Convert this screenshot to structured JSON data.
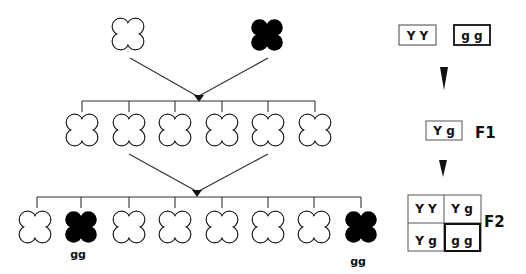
{
  "diagram": {
    "parents": [
      {
        "phenotype": "yellow",
        "fill": "#ffffff",
        "cx": 128,
        "cy": 34
      },
      {
        "phenotype": "green",
        "fill": "#000000",
        "cx": 267,
        "cy": 35
      }
    ],
    "f1_offspring": {
      "count": 6,
      "centers_x": [
        82,
        129,
        175,
        222,
        268,
        315
      ],
      "cy": 130,
      "fill": "#ffffff"
    },
    "f2_offspring": {
      "centers_x": [
        35,
        81,
        129,
        175,
        222,
        268,
        314,
        361
      ],
      "cy": 227,
      "fills": [
        "#ffffff",
        "#000000",
        "#ffffff",
        "#ffffff",
        "#ffffff",
        "#ffffff",
        "#ffffff",
        "#000000"
      ],
      "labels": [
        {
          "index": 1,
          "text": "gg"
        },
        {
          "index": 7,
          "text": "gg"
        }
      ]
    }
  },
  "genotypes": {
    "parent_1": "Y Y",
    "parent_2": "g g",
    "f1": "Y g",
    "f1_label": "F1",
    "f2_label": "F2",
    "punnett": [
      [
        "Y Y",
        "Y g"
      ],
      [
        "Y g",
        "g g"
      ]
    ]
  },
  "colors": {
    "line": "#333333",
    "ink": "#111111",
    "background": "#ffffff"
  }
}
